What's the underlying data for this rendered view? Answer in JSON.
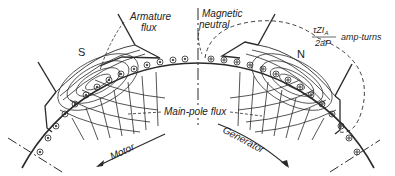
{
  "figure": {
    "labels": {
      "armature_flux": [
        "Armature",
        "flux"
      ],
      "magnetic_neutral": [
        "Magnetic",
        "neutral"
      ],
      "amp_turns_numerator": "τZI",
      "amp_turns_subscript": "A",
      "amp_turns_denominator": "2aP",
      "amp_turns_unit": "amp-turns",
      "main_pole_flux": "Main-pole flux",
      "motor": "Motor",
      "generator": "Generator",
      "pole_south": "S",
      "pole_north": "N"
    },
    "colors": {
      "ink": "#2a2a2a",
      "background": "#ffffff"
    }
  }
}
